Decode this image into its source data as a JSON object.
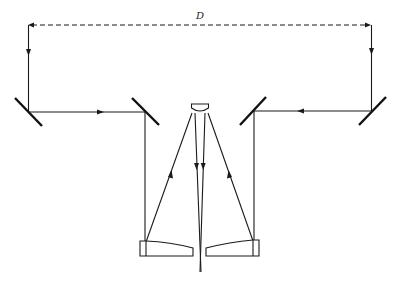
{
  "diagram": {
    "title": "",
    "labels": {
      "distance": "D"
    },
    "components": {
      "flat_mirrors": [
        "outer-left-flat-mirror",
        "inner-left-flat-mirror",
        "inner-right-flat-mirror",
        "outer-right-flat-mirror"
      ],
      "concave_mirrors": [
        "lower-left-concave-mirror",
        "lower-right-concave-mirror"
      ],
      "secondary_mirror": "central-convex-mirror",
      "paths": [
        "baseline-distance-dashed",
        "left-beam-path",
        "right-beam-path",
        "focal-output"
      ]
    },
    "colors": {
      "line": "#1a1a1a",
      "background": "#ffffff"
    }
  }
}
